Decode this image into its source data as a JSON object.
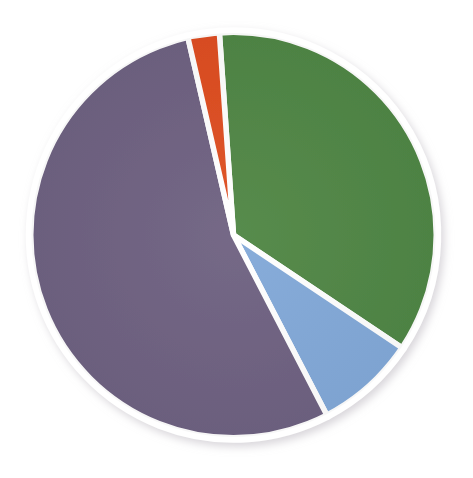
{
  "chart": {
    "title": "",
    "subtitle": "",
    "background_color": "#ffffff",
    "center_x": 233.5,
    "center_y": 235.0,
    "radius": 205.0,
    "start_angle_deg": -4.0,
    "slice_gap_color": "#ffffff",
    "slice_gap_width": 5.5
  },
  "chart_data": {
    "type": "pie",
    "title": "",
    "xlabel": "",
    "ylabel": "",
    "legend_position": "none",
    "grid": false,
    "labels": [
      "Green segment",
      "Blue segment",
      "Purple segment",
      "Orange segment"
    ],
    "values": [
      35.5,
      8.0,
      54.0,
      2.5
    ],
    "units": "percent",
    "colors": [
      "#4e8543",
      "#81a8d8",
      "#6d6080",
      "#de4c1f"
    ],
    "slices": [
      {
        "name": "Green segment",
        "value": 35.5,
        "color": "#4e8543",
        "start_angle_deg": -4.0,
        "end_angle_deg": 123.8
      },
      {
        "name": "Blue segment",
        "value": 8.0,
        "color": "#81a8d8",
        "start_angle_deg": 123.8,
        "end_angle_deg": 152.6
      },
      {
        "name": "Purple segment",
        "value": 54.0,
        "color": "#6d6080",
        "start_angle_deg": 152.6,
        "end_angle_deg": 347.0
      },
      {
        "name": "Orange segment",
        "value": 2.5,
        "color": "#de4c1f",
        "start_angle_deg": 347.0,
        "end_angle_deg": 356.0
      }
    ]
  }
}
